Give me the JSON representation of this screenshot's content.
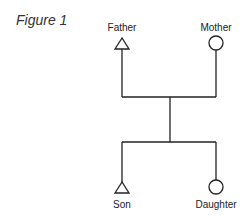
{
  "figure": {
    "title": "Figure 1"
  },
  "diagram": {
    "type": "family-tree",
    "colors": {
      "line": "#222222",
      "text": "#222222",
      "background": "#ffffff"
    },
    "parents": [
      {
        "label": "Father",
        "shape": "triangle"
      },
      {
        "label": "Mother",
        "shape": "circle"
      }
    ],
    "children": [
      {
        "label": "Son",
        "shape": "triangle"
      },
      {
        "label": "Daughter",
        "shape": "circle"
      }
    ]
  }
}
